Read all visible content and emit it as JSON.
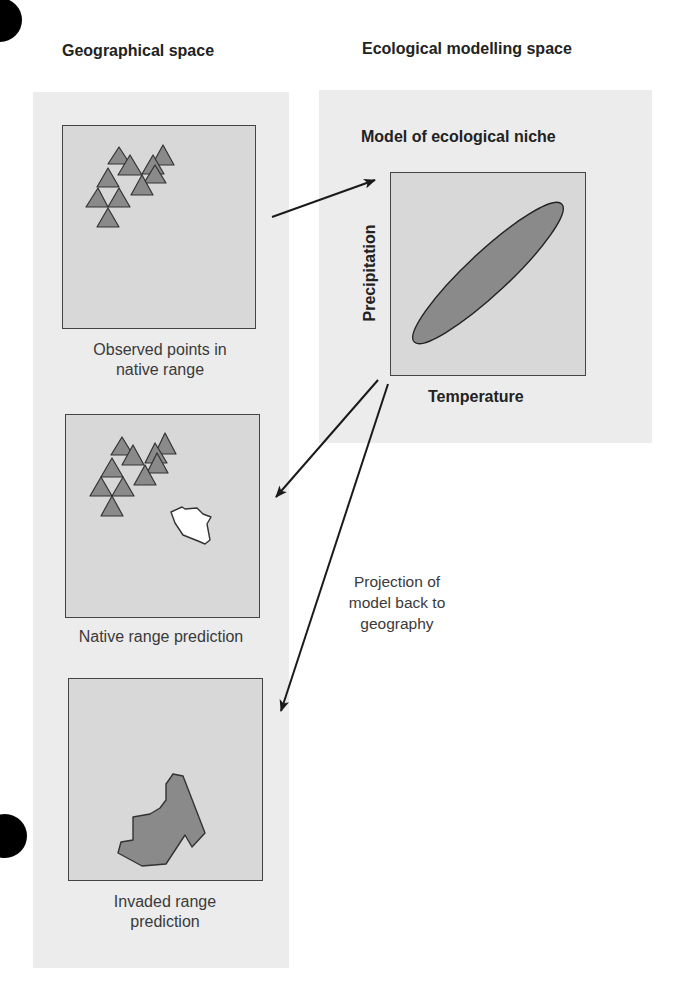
{
  "headings": {
    "geographical": "Geographical space",
    "ecological": "Ecological modelling space"
  },
  "panels": {
    "observed": {
      "caption_line1": "Observed points in",
      "caption_line2": "native range"
    },
    "native_prediction": {
      "caption": "Native range prediction"
    },
    "invaded_prediction": {
      "caption_line1": "Invaded range",
      "caption_line2": "prediction"
    },
    "niche_model": {
      "title": "Model of ecological niche",
      "x_axis": "Temperature",
      "y_axis": "Precipitation"
    }
  },
  "projection_note": {
    "line1": "Projection of",
    "line2": "model back to",
    "line3": "geography"
  },
  "colors": {
    "panel_background": "#ececec",
    "box_fill": "#d8d8d8",
    "marker_fill": "#8a8a8a",
    "outline": "#333333",
    "predicted_area_white": "#ffffff",
    "predicted_area_gray": "#8a8a8a"
  },
  "icons": {
    "occurrence_marker": "triangle-icon",
    "arrow": "arrow-icon"
  }
}
